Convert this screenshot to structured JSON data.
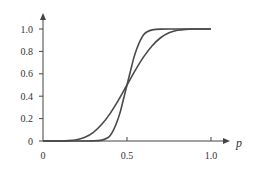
{
  "chart_data": {
    "type": "line",
    "title": "",
    "xlabel": "p",
    "ylabel": "",
    "xlim": [
      0,
      1.0
    ],
    "ylim": [
      0,
      1.0
    ],
    "grid": false,
    "legend": "none",
    "x_ticks": [
      "0",
      "0.5",
      "1.0"
    ],
    "x_tick_values": [
      0,
      0.5,
      1.0
    ],
    "y_ticks": [
      "0",
      "0.2",
      "0.4",
      "0.6",
      "0.8",
      "1.0"
    ],
    "y_tick_values": [
      0,
      0.2,
      0.4,
      0.6,
      0.8,
      1.0
    ],
    "series": [
      {
        "name": "gentle-sigmoid",
        "x": [
          0,
          0.05,
          0.1,
          0.15,
          0.2,
          0.25,
          0.3,
          0.35,
          0.4,
          0.45,
          0.5,
          0.55,
          0.6,
          0.65,
          0.7,
          0.75,
          0.8,
          0.85,
          0.9,
          0.95,
          1.0
        ],
        "values": [
          0,
          0,
          0.0003,
          0.003,
          0.012,
          0.034,
          0.078,
          0.149,
          0.247,
          0.367,
          0.5,
          0.633,
          0.753,
          0.851,
          0.922,
          0.966,
          0.988,
          0.997,
          0.9997,
          1.0,
          1.0
        ]
      },
      {
        "name": "steep-sigmoid",
        "x": [
          0,
          0.1,
          0.2,
          0.3,
          0.35,
          0.38,
          0.4,
          0.42,
          0.44,
          0.46,
          0.48,
          0.5,
          0.52,
          0.54,
          0.56,
          0.58,
          0.6,
          0.62,
          0.65,
          0.7,
          0.8,
          0.9,
          1.0
        ],
        "values": [
          0,
          0,
          0,
          0.0008,
          0.008,
          0.025,
          0.05,
          0.1,
          0.17,
          0.26,
          0.38,
          0.5,
          0.62,
          0.74,
          0.83,
          0.9,
          0.95,
          0.975,
          0.992,
          0.9992,
          1.0,
          1.0,
          1.0
        ]
      }
    ]
  }
}
